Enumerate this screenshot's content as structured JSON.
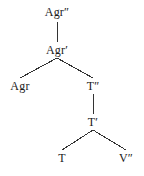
{
  "figure": {
    "type": "syntax-tree",
    "background_color": "#ffffff",
    "line_color": "#333333",
    "text_color": "#1a1a1a"
  },
  "nodes": [
    {
      "id": "agr-max",
      "label": "Agr″",
      "x": 57,
      "y": 6,
      "level": 0
    },
    {
      "id": "agr-bar",
      "label": "Agr′",
      "x": 57,
      "y": 44,
      "level": 1
    },
    {
      "id": "agr-head",
      "label": "Agr",
      "x": 20,
      "y": 80,
      "level": 2
    },
    {
      "id": "t-max",
      "label": "T″",
      "x": 93,
      "y": 80,
      "level": 2
    },
    {
      "id": "t-bar",
      "label": "T′",
      "x": 93,
      "y": 116,
      "level": 3
    },
    {
      "id": "t-head",
      "label": "T",
      "x": 62,
      "y": 152,
      "level": 4
    },
    {
      "id": "v-max",
      "label": "V″",
      "x": 126,
      "y": 152,
      "level": 4
    }
  ],
  "edges": [
    {
      "id": "edge-agrmax-agrbar",
      "from": "agr-max",
      "to": "agr-bar",
      "x1": 57,
      "y1": 22,
      "x2": 57,
      "y2": 42,
      "kind": "vertical"
    },
    {
      "id": "edge-agrbar-agrhead",
      "from": "agr-bar",
      "to": "agr-head",
      "x1": 57,
      "y1": 58,
      "x2": 20,
      "y2": 78,
      "kind": "diagonal-left"
    },
    {
      "id": "edge-agrbar-tmax",
      "from": "agr-bar",
      "to": "t-max",
      "x1": 57,
      "y1": 58,
      "x2": 93,
      "y2": 78,
      "kind": "diagonal-right"
    },
    {
      "id": "edge-tmax-tbar",
      "from": "t-max",
      "to": "t-bar",
      "x1": 93,
      "y1": 94,
      "x2": 93,
      "y2": 114,
      "kind": "vertical"
    },
    {
      "id": "edge-tbar-thead",
      "from": "t-bar",
      "to": "t-head",
      "x1": 93,
      "y1": 130,
      "x2": 62,
      "y2": 150,
      "kind": "diagonal-left"
    },
    {
      "id": "edge-tbar-vmax",
      "from": "t-bar",
      "to": "v-max",
      "x1": 93,
      "y1": 130,
      "x2": 126,
      "y2": 150,
      "kind": "diagonal-right"
    }
  ]
}
